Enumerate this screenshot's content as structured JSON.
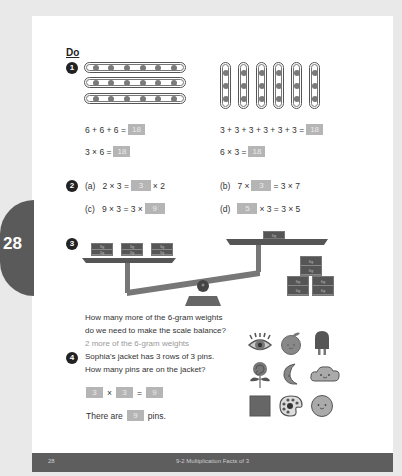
{
  "page": {
    "side_tab_number": "28",
    "section_label": "Do",
    "footer": {
      "page_number": "28",
      "title": "9-2  Multiplication Facts of 3"
    }
  },
  "q1": {
    "number": "1",
    "left": {
      "rows": 3,
      "dots_per_row": 6,
      "sum_eq": "6 + 6 + 6 =",
      "sum_ans": "18",
      "mult_eq": "3 × 6 =",
      "mult_ans": "18"
    },
    "right": {
      "columns": 6,
      "dots_per_column": 3,
      "sum_eq": "3 + 3 + 3 + 3 + 3 + 3 =",
      "sum_ans": "18",
      "mult_eq": "6 × 3 =",
      "mult_ans": "18"
    }
  },
  "q2": {
    "number": "2",
    "a": {
      "label": "(a)",
      "pre": "2 × 3 =",
      "ans": "3",
      "post": "× 2"
    },
    "b": {
      "label": "(b)",
      "pre": "7 ×",
      "ans": "3",
      "post": "= 3 × 7"
    },
    "c": {
      "label": "(c)",
      "pre": "9 × 3 = 3 ×",
      "ans": "9",
      "post": ""
    },
    "d": {
      "label": "(d)",
      "pre": "",
      "ans": "5",
      "post": "× 3 = 3 × 5"
    }
  },
  "q3": {
    "number": "3",
    "left_pan_weights": [
      "3g",
      "3g",
      "3g",
      "3g",
      "3g",
      "3g"
    ],
    "right_pan_weights": [
      "6g"
    ],
    "ground_weights": [
      "6g",
      "6g",
      "6g",
      "6g",
      "6g",
      "6g"
    ],
    "question_line1": "How many more of the 6-gram weights",
    "question_line2": "do we need to make the scale balance?",
    "answer": "2 more of the 6-gram weights"
  },
  "q4": {
    "number": "4",
    "question_line1": "Sophia's jacket has 3 rows of 3 pins.",
    "question_line2": "How many pins are on the jacket?",
    "eq": {
      "a": "3",
      "op1": "×",
      "b": "3",
      "op2": "=",
      "c": "9"
    },
    "sentence_pre": "There are",
    "sentence_ans": "9",
    "sentence_post": "pins.",
    "pins": [
      "eye-pin",
      "apple-pin",
      "popsicle-pin",
      "lollipop-pin",
      "moon-pin",
      "cloud-pin",
      "square-pin",
      "palette-pin",
      "smiley-pin"
    ]
  },
  "colors": {
    "page_bg": "#ffffff",
    "outer_bg": "#e9e9e9",
    "dark": "#5a5a5a",
    "answer_box": "#b5b5b5",
    "answer_text": "#999999"
  }
}
